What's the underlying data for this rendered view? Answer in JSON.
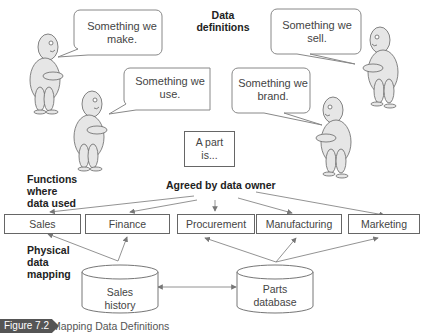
{
  "title": {
    "line1": "Data",
    "line2": "definitions"
  },
  "bubbles": [
    {
      "id": "make",
      "line1": "Something we",
      "line2": "make."
    },
    {
      "id": "use",
      "line1": "Something we",
      "line2": "use."
    },
    {
      "id": "sell",
      "line1": "Something we",
      "line2": "sell."
    },
    {
      "id": "brand",
      "line1": "Something we",
      "line2": "brand."
    }
  ],
  "definition_box": {
    "line1": "A part",
    "line2": "is..."
  },
  "labels": {
    "functions": [
      "Functions",
      "where",
      "data used"
    ],
    "agreed": "Agreed by data owner",
    "physical": [
      "Physical",
      "data",
      "mapping"
    ]
  },
  "functions": [
    {
      "label": "Sales"
    },
    {
      "label": "Finance"
    },
    {
      "label": "Procurement"
    },
    {
      "label": "Manufacturing"
    },
    {
      "label": "Marketing"
    }
  ],
  "databases": [
    {
      "line1": "Sales",
      "line2": "history"
    },
    {
      "line1": "Parts",
      "line2": "database"
    }
  ],
  "caption": {
    "tag": "Figure 7.2",
    "text": "Mapping Data Definitions"
  },
  "colors": {
    "figure_fill": "#e6e6e6",
    "stroke": "#666666",
    "caption_tag": "#555555"
  }
}
